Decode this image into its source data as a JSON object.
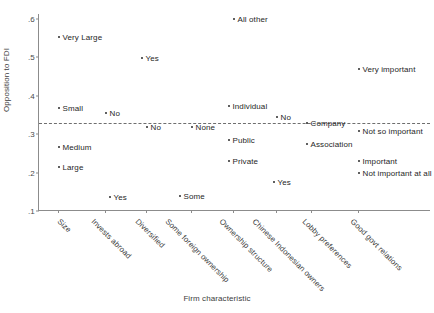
{
  "chart_data": {
    "type": "scatter",
    "title": "",
    "xlabel": "Firm characteristic",
    "ylabel": "Opposition to FDI",
    "ylim": [
      0.1,
      0.62
    ],
    "yticks": [
      ".6",
      ".5",
      ".4",
      ".3",
      ".2",
      ".1"
    ],
    "ytick_values": [
      0.6,
      0.5,
      0.4,
      0.3,
      0.2,
      0.1
    ],
    "grid": false,
    "legend": "none",
    "reference_line": {
      "value": 0.33,
      "style": "dashed",
      "orientation": "horizontal"
    },
    "categories": [
      "Size",
      "Invests abroad",
      "Diversified",
      "Some foreign ownership",
      "Ownership structure",
      "Chinese Indonesian owners",
      "Lobby preferences",
      "Good govt relations"
    ],
    "points": [
      {
        "label": "Very Large",
        "category": "Size",
        "x_px": 57,
        "value": 0.555
      },
      {
        "label": "Small",
        "category": "Size",
        "x_px": 57,
        "value": 0.368
      },
      {
        "label": "Medium",
        "category": "Size",
        "x_px": 57,
        "value": 0.268
      },
      {
        "label": "Large",
        "category": "Size",
        "x_px": 57,
        "value": 0.215
      },
      {
        "label": "Yes",
        "category": "Invests abroad",
        "x_px": 140,
        "value": 0.5
      },
      {
        "label": "No",
        "category": "Invests abroad",
        "x_px": 104,
        "value": 0.355
      },
      {
        "label": "Yes",
        "category": "Diversified",
        "x_px": 108,
        "value": 0.138
      },
      {
        "label": "No",
        "category": "Diversified",
        "x_px": 145,
        "value": 0.32
      },
      {
        "label": "None",
        "category": "Some foreign ownership",
        "x_px": 190,
        "value": 0.32
      },
      {
        "label": "Some",
        "category": "Some foreign ownership",
        "x_px": 178,
        "value": 0.14
      },
      {
        "label": "All other",
        "category": "Ownership structure",
        "x_px": 232,
        "value": 0.6
      },
      {
        "label": "Individual",
        "category": "Ownership structure",
        "x_px": 227,
        "value": 0.375
      },
      {
        "label": "Public",
        "category": "Ownership structure",
        "x_px": 227,
        "value": 0.285
      },
      {
        "label": "Private",
        "category": "Ownership structure",
        "x_px": 227,
        "value": 0.23
      },
      {
        "label": "No",
        "category": "Chinese Indonesian owners",
        "x_px": 275,
        "value": 0.345
      },
      {
        "label": "Yes",
        "category": "Chinese Indonesian owners",
        "x_px": 272,
        "value": 0.175
      },
      {
        "label": "Company",
        "category": "Lobby preferences",
        "x_px": 305,
        "value": 0.33
      },
      {
        "label": "Association",
        "category": "Lobby preferences",
        "x_px": 305,
        "value": 0.275
      },
      {
        "label": "Very important",
        "category": "Good govt relations",
        "x_px": 357,
        "value": 0.47
      },
      {
        "label": "Not so important",
        "category": "Good govt relations",
        "x_px": 357,
        "value": 0.31
      },
      {
        "label": "Important",
        "category": "Good govt relations",
        "x_px": 357,
        "value": 0.23
      },
      {
        "label": "Not important at all",
        "category": "Good govt relations",
        "x_px": 357,
        "value": 0.2
      }
    ],
    "category_tick_px": [
      57,
      104,
      145,
      190,
      232,
      275,
      310,
      357
    ],
    "category_label_px": [
      62,
      96,
      140,
      170,
      224,
      257,
      307,
      355
    ]
  }
}
